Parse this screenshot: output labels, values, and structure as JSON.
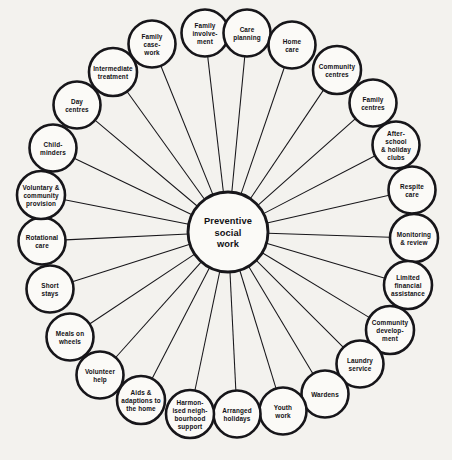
{
  "page": {
    "background_color": "#f3f2ee",
    "ink_color": "#17161a",
    "node_fill_color": "#fbfaf7"
  },
  "diagram": {
    "type": "radial-hub-and-spoke",
    "hub": {
      "label_lines": [
        "Preventive",
        "social",
        "work"
      ],
      "cx": 228,
      "cy": 232,
      "r": 40
    },
    "node_radius": 23.5,
    "nodes": [
      {
        "id": "family-involvement",
        "label_lines": [
          "Family",
          "involve-",
          "ment"
        ],
        "cx": 205,
        "cy": 33,
        "r": 23.5
      },
      {
        "id": "care-planning",
        "label_lines": [
          "Care",
          "planning"
        ],
        "cx": 247,
        "cy": 33,
        "r": 23.5
      },
      {
        "id": "home-care",
        "label_lines": [
          "Home",
          "care"
        ],
        "cx": 292,
        "cy": 45,
        "r": 23.5
      },
      {
        "id": "community-centres",
        "label_lines": [
          "Community",
          "centres"
        ],
        "cx": 337,
        "cy": 70,
        "r": 24
      },
      {
        "id": "family-centres",
        "label_lines": [
          "Family",
          "centres"
        ],
        "cx": 373,
        "cy": 103,
        "r": 23.5
      },
      {
        "id": "after-school-holiday-clubs",
        "label_lines": [
          "After-",
          "school",
          "& holiday",
          "clubs"
        ],
        "cx": 396,
        "cy": 145,
        "r": 23.5
      },
      {
        "id": "respite-care",
        "label_lines": [
          "Respite",
          "care"
        ],
        "cx": 412,
        "cy": 190,
        "r": 23.5
      },
      {
        "id": "monitoring-review",
        "label_lines": [
          "Monitoring",
          "& review"
        ],
        "cx": 414,
        "cy": 238,
        "r": 24
      },
      {
        "id": "limited-financial-assistance",
        "label_lines": [
          "Limited",
          "financial",
          "assistance"
        ],
        "cx": 408,
        "cy": 285,
        "r": 24
      },
      {
        "id": "community-development",
        "label_lines": [
          "Community",
          "develop-",
          "ment"
        ],
        "cx": 390,
        "cy": 330,
        "r": 24
      },
      {
        "id": "laundry-service",
        "label_lines": [
          "Laundry",
          "service"
        ],
        "cx": 360,
        "cy": 364,
        "r": 23.5
      },
      {
        "id": "wardens",
        "label_lines": [
          "Wardens"
        ],
        "cx": 325,
        "cy": 394,
        "r": 23.5
      },
      {
        "id": "youth-work",
        "label_lines": [
          "Youth",
          "work"
        ],
        "cx": 283,
        "cy": 411,
        "r": 23.5
      },
      {
        "id": "arranged-holidays",
        "label_lines": [
          "Arranged",
          "holidays"
        ],
        "cx": 237,
        "cy": 414,
        "r": 23.5
      },
      {
        "id": "harmonised-neighbourhood-support",
        "label_lines": [
          "Harmon-",
          "ised neigh-",
          "bourhood",
          "support"
        ],
        "cx": 190,
        "cy": 414,
        "r": 24
      },
      {
        "id": "aids-adaptions-to-the-home",
        "label_lines": [
          "Aids &",
          "adaptions to",
          "the home"
        ],
        "cx": 141,
        "cy": 400,
        "r": 24
      },
      {
        "id": "volunteer-help",
        "label_lines": [
          "Volunteer",
          "help"
        ],
        "cx": 100,
        "cy": 375,
        "r": 23.5
      },
      {
        "id": "meals-on-wheels",
        "label_lines": [
          "Meals on",
          "wheels"
        ],
        "cx": 70,
        "cy": 337,
        "r": 23.5
      },
      {
        "id": "short-stays",
        "label_lines": [
          "Short",
          "stays"
        ],
        "cx": 50,
        "cy": 289,
        "r": 23.5
      },
      {
        "id": "rotational-care",
        "label_lines": [
          "Rotational",
          "care"
        ],
        "cx": 42,
        "cy": 241,
        "r": 23.5
      },
      {
        "id": "voluntary-community-provision",
        "label_lines": [
          "Voluntary &",
          "community",
          "provision"
        ],
        "cx": 41,
        "cy": 195,
        "r": 24
      },
      {
        "id": "child-minders",
        "label_lines": [
          "Child-",
          "minders"
        ],
        "cx": 53,
        "cy": 148,
        "r": 23.5
      },
      {
        "id": "day-centres",
        "label_lines": [
          "Day",
          "centres"
        ],
        "cx": 77,
        "cy": 105,
        "r": 23.5
      },
      {
        "id": "intermediate-treatment",
        "label_lines": [
          "Intermediate",
          "treatment"
        ],
        "cx": 113,
        "cy": 72,
        "r": 24
      },
      {
        "id": "family-case-work",
        "label_lines": [
          "Family",
          "case-",
          "work"
        ],
        "cx": 152,
        "cy": 44,
        "r": 23.5
      }
    ]
  }
}
